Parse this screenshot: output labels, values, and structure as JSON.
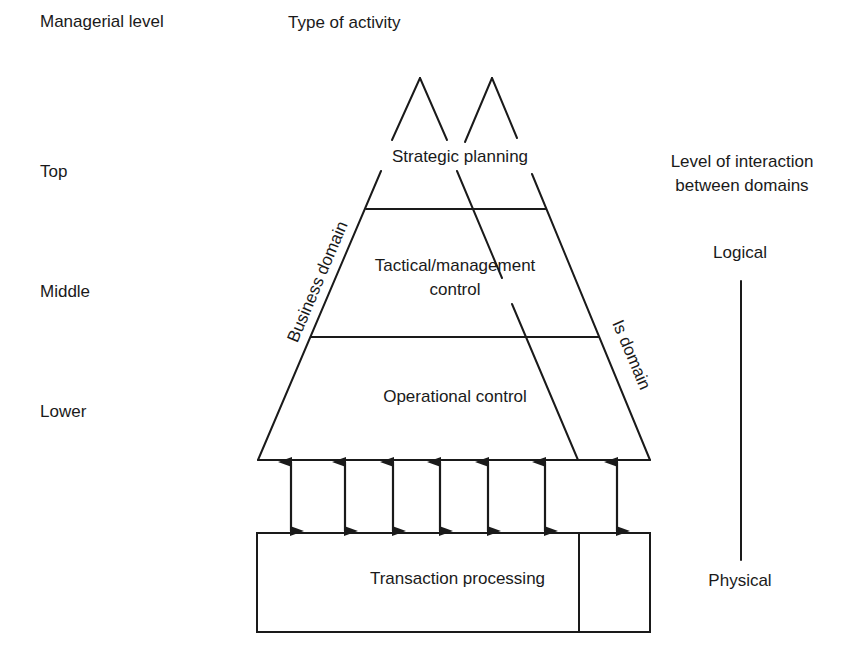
{
  "headers": {
    "managerial_level": "Managerial level",
    "type_of_activity": "Type of activity",
    "interaction_level": [
      "Level of interaction",
      "between domains"
    ]
  },
  "managerial_levels": [
    {
      "label": "Top"
    },
    {
      "label": "Middle"
    },
    {
      "label": "Lower"
    }
  ],
  "activities": {
    "strategic": "Strategic planning",
    "tactical": [
      "Tactical/management",
      "control"
    ],
    "operational": "Operational control",
    "transaction": "Transaction processing"
  },
  "domains": {
    "business": "Business domain",
    "is": "Is domain"
  },
  "interaction_scale": {
    "top": "Logical",
    "bottom": "Physical"
  },
  "arrows": {
    "count": 7,
    "x_positions": [
      291,
      345,
      393,
      440,
      488,
      545,
      617
    ]
  },
  "colors": {
    "ink": "#1a1a1a",
    "background": "#ffffff"
  }
}
